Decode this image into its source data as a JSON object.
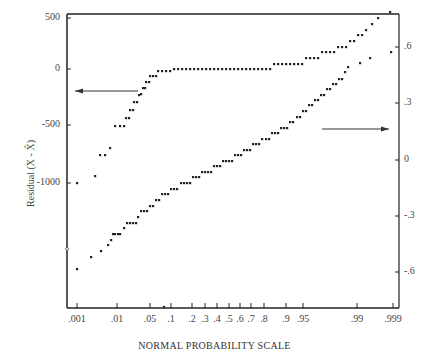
{
  "chart_data": {
    "type": "scatter",
    "title": "",
    "xlabel": "NORMAL PROBABILITY SCALE",
    "ylabel_left": "Residual (X - X̂)",
    "ylabel_right": "",
    "x_ticks": [
      ".001",
      ".01",
      ".05",
      ".1",
      ".2",
      ".3",
      ".4",
      ".5",
      ".6",
      ".7",
      ".8",
      ".9",
      ".95",
      ".99",
      ".999"
    ],
    "x_tick_px": [
      77,
      117,
      150,
      171,
      192,
      205,
      217,
      229,
      240,
      251,
      264,
      286,
      303,
      357,
      393
    ],
    "left_axis": {
      "ticks": [
        "500",
        "0",
        "-500",
        "-1000"
      ],
      "values": [
        500,
        0,
        -500,
        -1000
      ],
      "range": [
        -1000,
        500
      ]
    },
    "right_axis": {
      "ticks": [
        ".6",
        ".3",
        "0",
        "-.3",
        "-.6"
      ],
      "values": [
        0.6,
        0.3,
        0,
        -0.3,
        -0.6
      ]
    },
    "legend": [],
    "annotations": [
      {
        "type": "arrow",
        "direction": "left",
        "meaning": "upper series reads on left axis"
      },
      {
        "type": "arrow",
        "direction": "right",
        "meaning": "lower series reads on right axis"
      }
    ],
    "series": [
      {
        "name": "Residuals (left axis)",
        "axis": "left",
        "points_px": [
          [
            77,
            183
          ],
          [
            95,
            176
          ],
          [
            100,
            155
          ],
          [
            105,
            155
          ],
          [
            110,
            148
          ],
          [
            115,
            126
          ],
          [
            120,
            126
          ],
          [
            124,
            126
          ],
          [
            126,
            118
          ],
          [
            129,
            118
          ],
          [
            130,
            110
          ],
          [
            133,
            110
          ],
          [
            134,
            102
          ],
          [
            137,
            102
          ],
          [
            139,
            95
          ],
          [
            141,
            94
          ],
          [
            143,
            88
          ],
          [
            145,
            88
          ],
          [
            146,
            82
          ],
          [
            149,
            82
          ],
          [
            150,
            76
          ],
          [
            153,
            76
          ],
          [
            156,
            76
          ],
          [
            158,
            71
          ],
          [
            162,
            71
          ],
          [
            166,
            71
          ],
          [
            170,
            71
          ],
          [
            174,
            69
          ],
          [
            178,
            69
          ],
          [
            182,
            69
          ],
          [
            186,
            69
          ],
          [
            190,
            69
          ],
          [
            194,
            69
          ],
          [
            198,
            69
          ],
          [
            202,
            69
          ],
          [
            206,
            69
          ],
          [
            210,
            69
          ],
          [
            214,
            69
          ],
          [
            218,
            69
          ],
          [
            222,
            69
          ],
          [
            226,
            69
          ],
          [
            230,
            69
          ],
          [
            234,
            69
          ],
          [
            238,
            69
          ],
          [
            242,
            69
          ],
          [
            246,
            69
          ],
          [
            250,
            69
          ],
          [
            254,
            69
          ],
          [
            258,
            69
          ],
          [
            262,
            69
          ],
          [
            266,
            69
          ],
          [
            270,
            69
          ],
          [
            274,
            64
          ],
          [
            278,
            64
          ],
          [
            282,
            64
          ],
          [
            286,
            64
          ],
          [
            290,
            64
          ],
          [
            294,
            64
          ],
          [
            298,
            64
          ],
          [
            302,
            64
          ],
          [
            306,
            58
          ],
          [
            310,
            58
          ],
          [
            314,
            58
          ],
          [
            318,
            58
          ],
          [
            322,
            52
          ],
          [
            326,
            52
          ],
          [
            330,
            52
          ],
          [
            334,
            52
          ],
          [
            338,
            47
          ],
          [
            342,
            47
          ],
          [
            346,
            47
          ],
          [
            350,
            41
          ],
          [
            354,
            41
          ],
          [
            358,
            35
          ],
          [
            362,
            35
          ],
          [
            366,
            30
          ],
          [
            372,
            24
          ],
          [
            378,
            18
          ],
          [
            390,
            12
          ]
        ]
      },
      {
        "name": "Normalized residuals (right axis)",
        "axis": "right",
        "points_px": [
          [
            77,
            269
          ],
          [
            91,
            257
          ],
          [
            101,
            251
          ],
          [
            108,
            245
          ],
          [
            111,
            240
          ],
          [
            113,
            234
          ],
          [
            115,
            234
          ],
          [
            118,
            234
          ],
          [
            120,
            234
          ],
          [
            124,
            228
          ],
          [
            127,
            223
          ],
          [
            130,
            223
          ],
          [
            133,
            223
          ],
          [
            136,
            223
          ],
          [
            138,
            217
          ],
          [
            141,
            211
          ],
          [
            144,
            211
          ],
          [
            147,
            211
          ],
          [
            150,
            206
          ],
          [
            153,
            206
          ],
          [
            156,
            200
          ],
          [
            159,
            200
          ],
          [
            162,
            194
          ],
          [
            165,
            194
          ],
          [
            168,
            194
          ],
          [
            171,
            189
          ],
          [
            174,
            189
          ],
          [
            177,
            189
          ],
          [
            181,
            183
          ],
          [
            184,
            183
          ],
          [
            187,
            183
          ],
          [
            190,
            183
          ],
          [
            193,
            177
          ],
          [
            196,
            177
          ],
          [
            199,
            177
          ],
          [
            202,
            172
          ],
          [
            205,
            172
          ],
          [
            208,
            172
          ],
          [
            211,
            172
          ],
          [
            214,
            166
          ],
          [
            217,
            166
          ],
          [
            220,
            166
          ],
          [
            223,
            161
          ],
          [
            226,
            161
          ],
          [
            229,
            161
          ],
          [
            232,
            161
          ],
          [
            235,
            155
          ],
          [
            238,
            155
          ],
          [
            241,
            155
          ],
          [
            244,
            150
          ],
          [
            247,
            150
          ],
          [
            250,
            150
          ],
          [
            253,
            144
          ],
          [
            256,
            144
          ],
          [
            259,
            144
          ],
          [
            262,
            139
          ],
          [
            266,
            139
          ],
          [
            269,
            139
          ],
          [
            272,
            133
          ],
          [
            275,
            133
          ],
          [
            278,
            133
          ],
          [
            281,
            128
          ],
          [
            284,
            128
          ],
          [
            287,
            128
          ],
          [
            290,
            122
          ],
          [
            293,
            122
          ],
          [
            297,
            117
          ],
          [
            300,
            117
          ],
          [
            303,
            111
          ],
          [
            306,
            111
          ],
          [
            309,
            105
          ],
          [
            312,
            105
          ],
          [
            315,
            100
          ],
          [
            318,
            100
          ],
          [
            321,
            95
          ],
          [
            324,
            95
          ],
          [
            327,
            89
          ],
          [
            330,
            89
          ],
          [
            333,
            84
          ],
          [
            336,
            84
          ],
          [
            339,
            79
          ],
          [
            342,
            79
          ],
          [
            345,
            72
          ],
          [
            348,
            67
          ],
          [
            360,
            63
          ],
          [
            370,
            58
          ],
          [
            391,
            52
          ]
        ]
      }
    ],
    "axes_box_px": {
      "left": 67,
      "top": 14,
      "right": 399,
      "bottom": 308
    },
    "left_tick_px": [
      18,
      69,
      125,
      183
    ],
    "right_tick_px": [
      47,
      103,
      160,
      216,
      272
    ],
    "arrows_px": [
      {
        "x1": 138,
        "y1": 91,
        "x2": 75,
        "y2": 91
      },
      {
        "x1": 322,
        "y1": 129,
        "x2": 389,
        "y2": 129
      }
    ],
    "grid": false
  }
}
